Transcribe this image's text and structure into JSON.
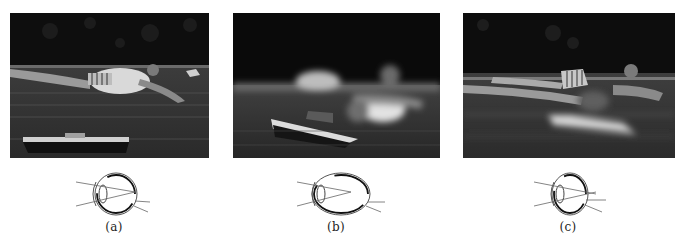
{
  "figure": {
    "panels": [
      {
        "id": "a",
        "label": "(a)",
        "photo_description": "Person lying on a pool float in sharp focus; toy boat in foreground also in focus",
        "eye_type": "normal",
        "eye_description": "Normal eye: light rays focus on the retina"
      },
      {
        "id": "b",
        "label": "(b)",
        "photo_description": "Near toy boat in focus, distant person on float blurred",
        "eye_type": "myopic",
        "eye_description": "Elongated eyeball (nearsighted): rays focus in front of the retina"
      },
      {
        "id": "c",
        "label": "(c)",
        "photo_description": "Distant person on float in focus, near toy boat blurred",
        "eye_type": "hyperopic",
        "eye_description": "Shortened eyeball (farsighted): rays focus behind the retina"
      }
    ],
    "colors": {
      "background": "#ffffff",
      "photo_dark": "#0c0c0c",
      "water": "#3a3a3a",
      "highlight": "#d8d8d8",
      "line": "#333333",
      "caption": "#222222"
    }
  }
}
